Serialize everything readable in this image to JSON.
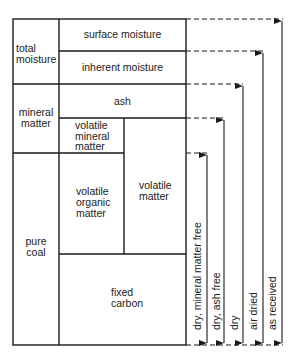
{
  "diagram": {
    "title": "",
    "left_column": [
      {
        "label": "total\nmoisture",
        "line1": "total",
        "line2": "moisture"
      },
      {
        "label": "mineral matter",
        "line1": "mineral",
        "line2": "matter"
      },
      {
        "label": "pure coal",
        "line1": "pure",
        "line2": "coal"
      }
    ],
    "components": {
      "surface_moisture": "surface moisture",
      "inherent_moisture": "inherent moisture",
      "ash": "ash",
      "volatile_mineral_matter": [
        "volatile",
        "mineral",
        "matter"
      ],
      "volatile_organic_matter": [
        "volatile",
        "organic",
        "matter"
      ],
      "volatile_matter": [
        "volatile",
        "matter"
      ],
      "fixed_carbon": [
        "fixed",
        "carbon"
      ]
    },
    "bases": [
      {
        "label": "dry, mineral matter free"
      },
      {
        "label": "dry, ash free"
      },
      {
        "label": "dry"
      },
      {
        "label": "air dried"
      },
      {
        "label": "as received"
      }
    ],
    "colors": {
      "line": "#1a1a1a",
      "background": "#ffffff"
    }
  }
}
